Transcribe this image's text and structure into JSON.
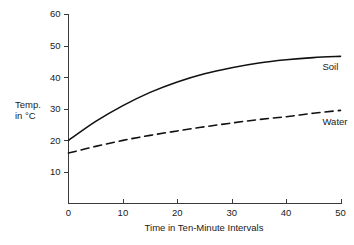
{
  "chart_data": {
    "type": "line",
    "title": "",
    "subtitle": "",
    "xlabel": "Time in Ten-Minute Intervals",
    "ylabel": "Temp. in °C",
    "ylabel_line1": "Temp.",
    "ylabel_line2": "in °C",
    "xlim": [
      0,
      50
    ],
    "ylim": [
      0,
      60
    ],
    "xticks": [
      0,
      10,
      20,
      30,
      40,
      50
    ],
    "yticks": [
      10,
      20,
      30,
      40,
      50,
      60
    ],
    "xtick_labels": [
      "0",
      "10",
      "20",
      "30",
      "40",
      "50"
    ],
    "ytick_labels": [
      "10",
      "20",
      "30",
      "40",
      "50",
      "60"
    ],
    "grid": false,
    "legend_position": "inline-right",
    "x": [
      0,
      5,
      10,
      15,
      20,
      25,
      30,
      35,
      40,
      45,
      50
    ],
    "series": [
      {
        "name": "Soil",
        "style": "solid",
        "color": "#111111",
        "label": "Soil",
        "values": [
          20.0,
          26.0,
          31.0,
          35.2,
          38.5,
          41.1,
          43.0,
          44.5,
          45.5,
          46.2,
          46.6
        ]
      },
      {
        "name": "Water",
        "style": "dashed",
        "color": "#111111",
        "label": "Water",
        "values": [
          16.0,
          18.1,
          20.0,
          21.6,
          23.0,
          24.3,
          25.5,
          26.6,
          27.5,
          28.6,
          29.5
        ]
      }
    ]
  }
}
